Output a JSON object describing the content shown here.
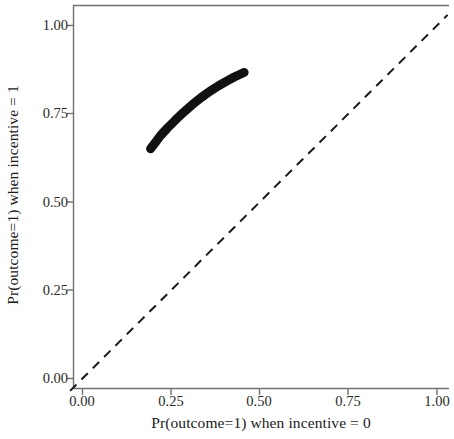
{
  "chart_data": {
    "type": "line",
    "title": "",
    "xlabel": "Pr(outcome=1) when incentive = 0",
    "ylabel": "Pr(outcome=1) when incentive = 1",
    "xlim": [
      -0.04,
      1.03
    ],
    "ylim": [
      -0.04,
      1.04
    ],
    "xticks": [
      0.0,
      0.25,
      0.5,
      0.75,
      1.0
    ],
    "xticklabels": [
      "0.00",
      "0.25",
      "0.50",
      "0.75",
      "1.00"
    ],
    "yticks": [
      0.0,
      0.25,
      0.5,
      0.75,
      1.0
    ],
    "yticklabels": [
      "0.00",
      "0.25",
      "0.50",
      "0.75",
      "1.00"
    ],
    "grid": false,
    "legend": null,
    "series": [
      {
        "name": "identity-reference-line",
        "style": "dashed",
        "color": "#1a1a1a",
        "linewidth": 2,
        "x": [
          -0.035,
          1.03
        ],
        "y": [
          -0.035,
          1.03
        ]
      },
      {
        "name": "estimated-response-curve",
        "style": "solid",
        "color": "#111111",
        "linewidth": 9,
        "x": [
          0.192,
          0.205,
          0.22,
          0.24,
          0.262,
          0.285,
          0.31,
          0.335,
          0.36,
          0.385,
          0.408,
          0.428,
          0.445,
          0.456
        ],
        "y": [
          0.651,
          0.668,
          0.688,
          0.71,
          0.732,
          0.754,
          0.776,
          0.796,
          0.814,
          0.83,
          0.843,
          0.854,
          0.862,
          0.867
        ]
      }
    ]
  },
  "axes": {
    "x_tick_labels": [
      "0.00",
      "0.25",
      "0.50",
      "0.75",
      "1.00"
    ],
    "y_tick_labels": [
      "0.00",
      "0.25",
      "0.50",
      "0.75",
      "1.00"
    ],
    "x_title": "Pr(outcome=1) when incentive = 0",
    "y_title": "Pr(outcome=1) when incentive = 1"
  },
  "colors": {
    "curve": "#111111",
    "reference_line": "#1a1a1a",
    "axis": "#595959",
    "text": "#1a1a1a",
    "background": "#ffffff"
  }
}
